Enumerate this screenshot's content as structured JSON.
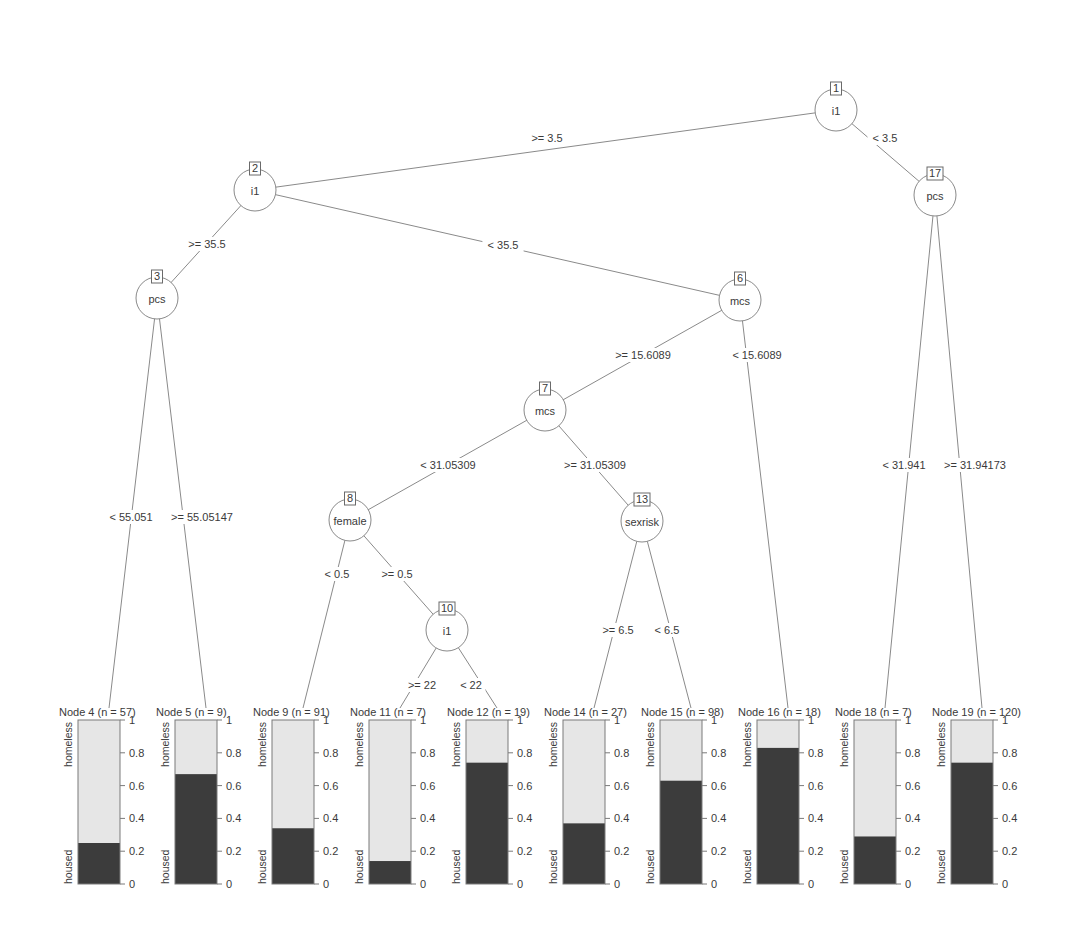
{
  "chart_data": {
    "type": "decision-tree",
    "title": "",
    "response_classes": [
      "housed",
      "homeless"
    ],
    "bar_axis_ticks": [
      "0",
      "0.2",
      "0.4",
      "0.6",
      "0.8",
      "1"
    ],
    "colors": {
      "housed": "#3c3c3c",
      "homeless": "#e6e6e6",
      "line": "#8a8a8a",
      "text": "#3a3a3a"
    },
    "inner_nodes": [
      {
        "id": 1,
        "var": "i1",
        "x": 836,
        "y": 110
      },
      {
        "id": 2,
        "var": "i1",
        "x": 255,
        "y": 190
      },
      {
        "id": 3,
        "var": "pcs",
        "x": 157,
        "y": 298
      },
      {
        "id": 6,
        "var": "mcs",
        "x": 740,
        "y": 300
      },
      {
        "id": 7,
        "var": "mcs",
        "x": 545,
        "y": 410
      },
      {
        "id": 8,
        "var": "female",
        "x": 350,
        "y": 520
      },
      {
        "id": 10,
        "var": "i1",
        "x": 447,
        "y": 630
      },
      {
        "id": 13,
        "var": "sexrisk",
        "x": 642,
        "y": 521
      },
      {
        "id": 17,
        "var": "pcs",
        "x": 935,
        "y": 195
      }
    ],
    "terminal_nodes": [
      {
        "id": 4,
        "n": 57,
        "housed": 0.25,
        "x": 103
      },
      {
        "id": 5,
        "n": 9,
        "housed": 0.67,
        "x": 200
      },
      {
        "id": 9,
        "n": 91,
        "housed": 0.34,
        "x": 297
      },
      {
        "id": 11,
        "n": 7,
        "housed": 0.14,
        "x": 394
      },
      {
        "id": 12,
        "n": 19,
        "housed": 0.74,
        "x": 491
      },
      {
        "id": 14,
        "n": 27,
        "housed": 0.37,
        "x": 588
      },
      {
        "id": 15,
        "n": 98,
        "housed": 0.63,
        "x": 685
      },
      {
        "id": 16,
        "n": 18,
        "housed": 0.83,
        "x": 782
      },
      {
        "id": 18,
        "n": 7,
        "housed": 0.29,
        "x": 879
      },
      {
        "id": 19,
        "n": 120,
        "housed": 0.74,
        "x": 976
      }
    ],
    "edges": [
      {
        "from": 1,
        "to": 2,
        "label": ">= 3.5",
        "lx": 547,
        "ly": 140
      },
      {
        "from": 1,
        "to": 17,
        "label": "< 3.5",
        "lx": 885,
        "ly": 140
      },
      {
        "from": 2,
        "to": 3,
        "label": ">= 35.5",
        "lx": 207,
        "ly": 246
      },
      {
        "from": 2,
        "to": 6,
        "label": "< 35.5",
        "lx": 503,
        "ly": 247
      },
      {
        "from": 3,
        "to": 4,
        "label": "< 55.051",
        "lx": 131,
        "ly": 519
      },
      {
        "from": 3,
        "to": 5,
        "label": ">= 55.05147",
        "lx": 202,
        "ly": 519
      },
      {
        "from": 6,
        "to": 7,
        "label": ">= 15.6089",
        "lx": 643,
        "ly": 357
      },
      {
        "from": 6,
        "to": 16,
        "label": "< 15.6089",
        "lx": 757,
        "ly": 357
      },
      {
        "from": 7,
        "to": 8,
        "label": "< 31.05309",
        "lx": 448,
        "ly": 467
      },
      {
        "from": 7,
        "to": 13,
        "label": ">= 31.05309",
        "lx": 595,
        "ly": 467
      },
      {
        "from": 8,
        "to": 9,
        "label": "< 0.5",
        "lx": 337,
        "ly": 576
      },
      {
        "from": 8,
        "to": 10,
        "label": ">= 0.5",
        "lx": 397,
        "ly": 576
      },
      {
        "from": 10,
        "to": 11,
        "label": ">= 22",
        "lx": 422,
        "ly": 687
      },
      {
        "from": 10,
        "to": 12,
        "label": "< 22",
        "lx": 471,
        "ly": 687
      },
      {
        "from": 13,
        "to": 14,
        "label": ">= 6.5",
        "lx": 618,
        "ly": 632
      },
      {
        "from": 13,
        "to": 15,
        "label": "< 6.5",
        "lx": 667,
        "ly": 632
      },
      {
        "from": 17,
        "to": 18,
        "label": "< 31.941",
        "lx": 904,
        "ly": 467
      },
      {
        "from": 17,
        "to": 19,
        "label": ">= 31.94173",
        "lx": 975,
        "ly": 467
      }
    ]
  }
}
